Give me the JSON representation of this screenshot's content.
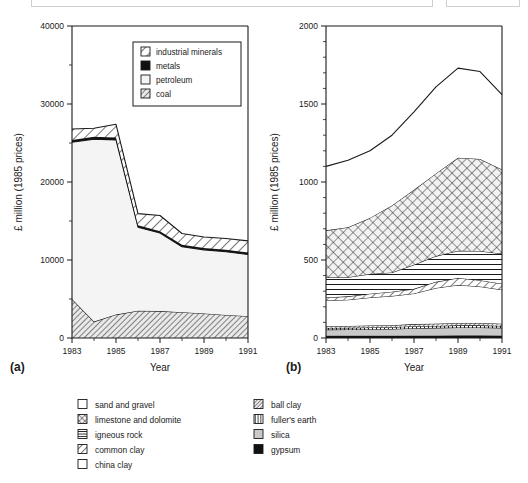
{
  "figure": {
    "panels": [
      {
        "id": "a",
        "panel_label": "(a)",
        "legend_position": "inside-top-right",
        "legend_entries": [
          {
            "label": "industrial minerals",
            "pattern": "diagonal-hatch-sparse"
          },
          {
            "label": "metals",
            "pattern": "solid-black"
          },
          {
            "label": "petroleum",
            "pattern": "empty-white"
          },
          {
            "label": "coal",
            "pattern": "diagonal-hatch-dense"
          }
        ]
      },
      {
        "id": "b",
        "panel_label": "(b)",
        "legend_position": "below-figure"
      }
    ],
    "bottom_legend": {
      "column_left": [
        {
          "label": "sand and gravel",
          "pattern": "empty-white"
        },
        {
          "label": "limestone and dolomite",
          "pattern": "cross-hatch"
        },
        {
          "label": "igneous rock",
          "pattern": "horizontal-lines"
        },
        {
          "label": "common clay",
          "pattern": "diagonal-hatch-sparse"
        },
        {
          "label": "china clay",
          "pattern": "empty-white"
        }
      ],
      "column_right": [
        {
          "label": "ball clay",
          "pattern": "diagonal-hatch-dense"
        },
        {
          "label": "fuller's earth",
          "pattern": "vertical-lines"
        },
        {
          "label": "silica",
          "pattern": "light-gray"
        },
        {
          "label": "gypsum",
          "pattern": "solid-black"
        }
      ]
    }
  },
  "chart_data": [
    {
      "type": "area",
      "stacked": true,
      "title": "",
      "panel": "(a)",
      "xlabel": "Year",
      "ylabel": "£ million (1985 prices)",
      "xlim": [
        1983,
        1991
      ],
      "ylim": [
        0,
        40000
      ],
      "xticks": [
        1983,
        1985,
        1987,
        1989,
        1991
      ],
      "xtick_labels": [
        "1983",
        "1985",
        "1987",
        "1989",
        "1991"
      ],
      "yticks": [
        0,
        10000,
        20000,
        30000,
        40000
      ],
      "ytick_labels": [
        "0",
        "10000",
        "20000",
        "30000",
        "40000"
      ],
      "yminor_ticks": [
        5000,
        15000,
        25000,
        35000
      ],
      "grid": false,
      "x": [
        1983,
        1984,
        1985,
        1986,
        1987,
        1988,
        1989,
        1990,
        1991
      ],
      "series": [
        {
          "name": "coal",
          "pattern": "diagonal-hatch-dense",
          "values": [
            5000,
            2100,
            3000,
            3500,
            3450,
            3300,
            3150,
            2950,
            2800
          ]
        },
        {
          "name": "petroleum",
          "pattern": "empty-white",
          "values": [
            20100,
            23400,
            22400,
            10700,
            10000,
            8400,
            8150,
            8100,
            7900
          ]
        },
        {
          "name": "metals",
          "pattern": "solid-black",
          "values": [
            300,
            300,
            300,
            250,
            250,
            250,
            250,
            250,
            250
          ]
        },
        {
          "name": "industrial minerals",
          "pattern": "diagonal-hatch-sparse",
          "values": [
            1400,
            1100,
            1700,
            1500,
            2000,
            1450,
            1400,
            1450,
            1500
          ]
        }
      ],
      "series_totals": [
        26800,
        26900,
        27400,
        15950,
        15700,
        13400,
        12950,
        12750,
        12450
      ]
    },
    {
      "type": "area",
      "stacked": true,
      "title": "",
      "panel": "(b)",
      "xlabel": "Year",
      "ylabel": "£ million (1985 prices)",
      "xlim": [
        1983,
        1991
      ],
      "ylim": [
        0,
        2000
      ],
      "xticks": [
        1983,
        1985,
        1987,
        1989,
        1991
      ],
      "xtick_labels": [
        "1983",
        "1985",
        "1987",
        "1989",
        "1991"
      ],
      "yticks": [
        0,
        500,
        1000,
        1500,
        2000
      ],
      "ytick_labels": [
        "0",
        "500",
        "1000",
        "1500",
        "2000"
      ],
      "yminor_ticks": [
        100,
        200,
        300,
        400,
        600,
        700,
        800,
        900,
        1100,
        1200,
        1300,
        1400,
        1600,
        1700,
        1800,
        1900
      ],
      "grid": false,
      "x": [
        1983,
        1984,
        1985,
        1986,
        1987,
        1988,
        1989,
        1990,
        1991
      ],
      "series": [
        {
          "name": "gypsum",
          "pattern": "solid-black",
          "values": [
            14,
            14,
            14,
            14,
            15,
            15,
            16,
            16,
            15
          ]
        },
        {
          "name": "silica",
          "pattern": "light-gray",
          "values": [
            40,
            41,
            42,
            44,
            48,
            50,
            52,
            52,
            50
          ]
        },
        {
          "name": "fuller's earth",
          "pattern": "vertical-lines",
          "values": [
            10,
            10,
            11,
            11,
            12,
            12,
            13,
            13,
            12
          ]
        },
        {
          "name": "ball clay",
          "pattern": "diagonal-hatch-dense",
          "values": [
            12,
            12,
            13,
            13,
            14,
            15,
            15,
            15,
            14
          ]
        },
        {
          "name": "china clay",
          "pattern": "empty-white",
          "values": [
            164,
            168,
            180,
            188,
            196,
            228,
            244,
            234,
            219
          ]
        },
        {
          "name": "common clay",
          "pattern": "diagonal-hatch-sparse",
          "values": [
            20,
            22,
            24,
            26,
            30,
            40,
            45,
            40,
            38
          ]
        },
        {
          "name": "igneous rock",
          "pattern": "horizontal-lines",
          "values": [
            130,
            123,
            126,
            124,
            155,
            165,
            175,
            188,
            192
          ]
        },
        {
          "name": "limestone and dolomite",
          "pattern": "cross-hatch",
          "values": [
            300,
            320,
            360,
            430,
            480,
            530,
            595,
            590,
            540
          ]
        },
        {
          "name": "sand and gravel",
          "pattern": "empty-white",
          "values": [
            410,
            430,
            430,
            450,
            500,
            555,
            575,
            560,
            480
          ]
        }
      ],
      "series_totals": [
        1100,
        1140,
        1200,
        1300,
        1450,
        1610,
        1730,
        1708,
        1560
      ]
    }
  ]
}
